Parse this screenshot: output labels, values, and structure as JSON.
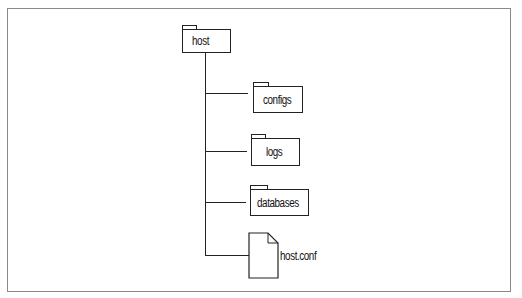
{
  "diagram": {
    "type": "directory-tree",
    "root": {
      "name": "host",
      "kind": "folder"
    },
    "children": [
      {
        "name": "configs",
        "kind": "folder"
      },
      {
        "name": "logs",
        "kind": "folder"
      },
      {
        "name": "databases",
        "kind": "folder"
      },
      {
        "name": "host.conf",
        "kind": "file"
      }
    ]
  },
  "colors": {
    "stroke": "#222222",
    "frame": "#8a8a8a",
    "background": "#ffffff"
  }
}
